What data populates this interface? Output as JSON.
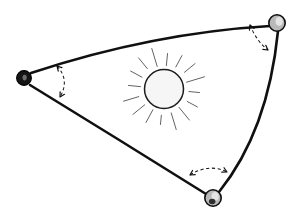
{
  "figure": {
    "background_color": "#ffffff",
    "width": 302,
    "height": 217,
    "stroke_color": "#101010",
    "dash_color": "#1a1a1a",
    "ray_color": "#5b5b5b"
  },
  "vertices": [
    {
      "id": "vertex-left",
      "label": "left-vertex-node",
      "x": 24,
      "y": 78,
      "radius": 7.4,
      "style": "filled-dark",
      "fill_color": "#151515"
    },
    {
      "id": "vertex-top-right",
      "label": "top-right-vertex-node",
      "x": 277,
      "y": 23,
      "radius": 8.2,
      "style": "shaded-gray",
      "fill_color": "#b9b9b9"
    },
    {
      "id": "vertex-bottom",
      "label": "bottom-vertex-node",
      "x": 213,
      "y": 198,
      "radius": 8.2,
      "style": "shaded-gray-dark",
      "fill_color": "#b9b9b9"
    }
  ],
  "edges": [
    {
      "id": "edge-top",
      "label": "top-edge-left-to-top-right",
      "path": "M 31 73 Q 152 33 270 26",
      "curvature": "convex-outward"
    },
    {
      "id": "edge-left-bottom",
      "label": "left-edge-left-to-bottom",
      "path": "M 30 85 Q 118 139 206 194",
      "curvature": "convex-outward"
    },
    {
      "id": "edge-right",
      "label": "right-edge-top-right-to-bottom",
      "path": "M 278 31 Q 268 131 219 192",
      "curvature": "convex-outward"
    }
  ],
  "angle_arcs": [
    {
      "id": "arc-left",
      "label": "left-vertex-angle-arc",
      "path": "M 57 66 Q 70 80 60 97",
      "arrows": "both-ends"
    },
    {
      "id": "arc-top-right",
      "label": "top-right-vertex-angle-arc",
      "path": "M 250 25 Q 257 42 268 50",
      "arrows": "both-ends"
    },
    {
      "id": "arc-bottom",
      "label": "bottom-vertex-angle-arc",
      "path": "M 190 175 Q 209 163 227 172",
      "arrows": "both-ends"
    }
  ],
  "sun": {
    "id": "sun-symbol",
    "label": "central-sun-icon",
    "center_x": 164,
    "center_y": 89,
    "disc_radius": 19.5,
    "disc_fill": "#f6f6f6",
    "disc_stroke": "#1c1c1c",
    "ray_count": 16,
    "ray_inner_radius": 25,
    "ray_outer_radius": 39,
    "ray_color": "#5b5b5b"
  }
}
